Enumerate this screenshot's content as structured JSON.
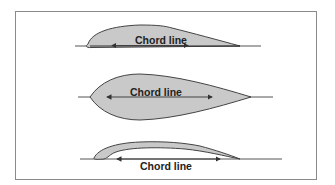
{
  "diagram": {
    "type": "airfoil-chord-line-comparison",
    "colors": {
      "border": "#8a8a8a",
      "fill": "#c9c9c9",
      "outline": "#444444",
      "chord_line": "#555555",
      "text": "#222222"
    },
    "airfoils": [
      {
        "name": "cambered-airfoil",
        "label": "Chord line",
        "label_position": "inside"
      },
      {
        "name": "symmetrical-airfoil",
        "label": "Chord line",
        "label_position": "inside"
      },
      {
        "name": "highly-cambered-airfoil",
        "label": "Chord line",
        "label_position": "below"
      }
    ]
  }
}
